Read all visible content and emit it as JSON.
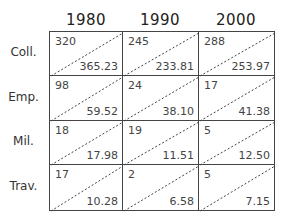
{
  "columns": [
    "1980",
    "1990",
    "2000"
  ],
  "rows": [
    {
      "label": "Coll.",
      "cells": [
        {
          "observed": "320",
          "expected": "365.23"
        },
        {
          "observed": "245",
          "expected": "233.81"
        },
        {
          "observed": "288",
          "expected": "253.97"
        }
      ]
    },
    {
      "label": "Emp.",
      "cells": [
        {
          "observed": "98",
          "expected": "59.52"
        },
        {
          "observed": "24",
          "expected": "38.10"
        },
        {
          "observed": "17",
          "expected": "41.38"
        }
      ]
    },
    {
      "label": "Mil.",
      "cells": [
        {
          "observed": "18",
          "expected": "17.98"
        },
        {
          "observed": "19",
          "expected": "11.51"
        },
        {
          "observed": "5",
          "expected": "12.50"
        }
      ]
    },
    {
      "label": "Trav.",
      "cells": [
        {
          "observed": "17",
          "expected": "10.28"
        },
        {
          "observed": "2",
          "expected": "6.58"
        },
        {
          "observed": "5",
          "expected": "7.15"
        }
      ]
    }
  ]
}
